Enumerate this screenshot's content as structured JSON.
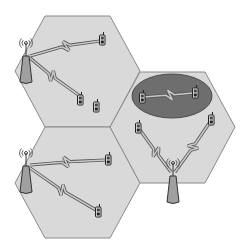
{
  "diagram": {
    "colors": {
      "background": "#ffffff",
      "cell_fill": "#d9d9d9",
      "cell_stroke": "#8a8a8a",
      "adhoc_fill": "#6e6e6e",
      "adhoc_stroke": "#4a4a4a",
      "link_fill": "#c8c8c8",
      "link_stroke": "#555555",
      "tower_fill": "#a0a0a0",
      "tower_stroke": "#333333",
      "phone_fill": "#e8e8e8",
      "phone_stroke": "#222222"
    },
    "cells": [
      {
        "id": "cell-top-left",
        "points": "45,16 110,16 140,71 110,127 45,127 15,71",
        "base_station": {
          "x": 26,
          "y": 56,
          "label": "base-station"
        },
        "mobiles": [
          {
            "x": 102,
            "y": 40
          },
          {
            "x": 80,
            "y": 100
          },
          {
            "x": 96,
            "y": 107
          }
        ],
        "links": [
          {
            "from": [
              30,
              56
            ],
            "to": [
              100,
              41
            ],
            "bolt_at": [
              66,
              46
            ]
          },
          {
            "from": [
              30,
              58
            ],
            "to": [
              80,
              96
            ],
            "bolt_at": [
              52,
              76
            ]
          }
        ]
      },
      {
        "id": "cell-bottom-left",
        "points": "45,127 110,127 140,183 110,238 45,238 15,183",
        "base_station": {
          "x": 26,
          "y": 166,
          "label": "base-station"
        },
        "mobiles": [
          {
            "x": 108,
            "y": 160
          },
          {
            "x": 98,
            "y": 212
          }
        ],
        "links": [
          {
            "from": [
              30,
              165
            ],
            "to": [
              106,
              160
            ],
            "bolt_at": [
              66,
              162
            ]
          },
          {
            "from": [
              30,
              168
            ],
            "to": [
              96,
              210
            ],
            "bolt_at": [
              62,
              190
            ]
          }
        ]
      },
      {
        "id": "cell-right",
        "points": "140,72 205,72 235,127 205,183 140,183 110,127",
        "base_station": {
          "x": 173,
          "y": 176,
          "label": "base-station"
        },
        "mobiles": [
          {
            "x": 138,
            "y": 128
          },
          {
            "x": 211,
            "y": 120
          }
        ],
        "links": [
          {
            "from": [
              171,
              172
            ],
            "to": [
              140,
              130
            ],
            "bolt_at": [
              156,
              152
            ]
          },
          {
            "from": [
              175,
              172
            ],
            "to": [
              210,
              122
            ],
            "bolt_at": [
              193,
              147
            ]
          }
        ]
      }
    ],
    "adhoc_group": {
      "label": "ad-hoc-cluster",
      "ellipse": {
        "cx": 172,
        "cy": 96,
        "rx": 40,
        "ry": 22
      },
      "mobiles": [
        {
          "x": 142,
          "y": 98
        },
        {
          "x": 195,
          "y": 93
        }
      ],
      "link": {
        "from": [
          144,
          97
        ],
        "to": [
          193,
          93
        ],
        "bolt_at": [
          170,
          95
        ]
      }
    }
  }
}
